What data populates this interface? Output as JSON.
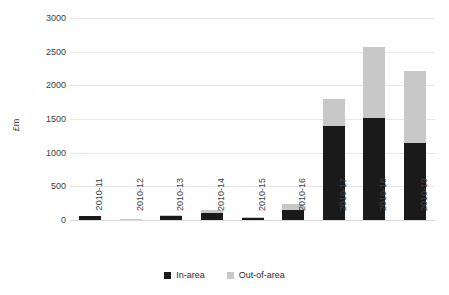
{
  "chart_data": {
    "type": "bar",
    "stacked": true,
    "title": "",
    "xlabel": "",
    "ylabel": "£m",
    "ylim": [
      0,
      3000
    ],
    "ytick_step": 500,
    "yticks": [
      "3000",
      "2500",
      "2000",
      "1500",
      "1000",
      "500",
      "0"
    ],
    "grid": true,
    "legend_position": "bottom",
    "categories": [
      "2010-11",
      "2010-12",
      "2010-13",
      "2010-14",
      "2010-15",
      "2010-16",
      "2010-17",
      "2010-18",
      "2010-19"
    ],
    "series": [
      {
        "name": "In-area",
        "color": "#1a1a1a",
        "values": [
          60,
          10,
          70,
          110,
          45,
          150,
          1400,
          1520,
          1150
        ]
      },
      {
        "name": "Out-of-area",
        "color": "#c8c8c8",
        "values": [
          0,
          10,
          5,
          35,
          5,
          90,
          400,
          1050,
          1060
        ]
      }
    ],
    "totals": [
      60,
      20,
      75,
      145,
      50,
      240,
      1800,
      2570,
      2210
    ]
  },
  "colors": {
    "in_area": "#1a1a1a",
    "out_of_area": "#c8c8c8",
    "grid": "#e8e8e8",
    "text": "#404040",
    "background": "#ffffff"
  }
}
